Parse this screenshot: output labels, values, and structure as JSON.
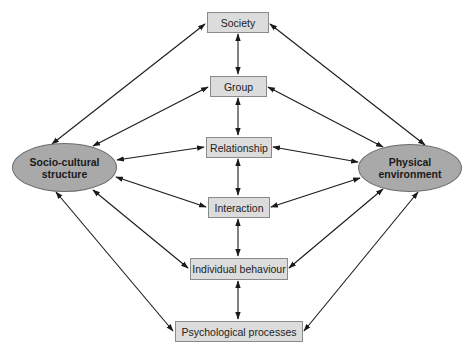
{
  "diagram": {
    "nodes": {
      "society": "Society",
      "group": "Group",
      "relationship": "Relationship",
      "interaction": "Interaction",
      "individual_behaviour": "Individual behaviour",
      "psychological_processes": "Psychological processes",
      "socio_cultural_line1": "Socio-cultural",
      "socio_cultural_line2": "structure",
      "physical_line1": "Physical",
      "physical_line2": "environment"
    },
    "edges": [
      [
        "Society",
        "Group",
        "bidirectional"
      ],
      [
        "Group",
        "Relationship",
        "bidirectional"
      ],
      [
        "Relationship",
        "Interaction",
        "bidirectional"
      ],
      [
        "Interaction",
        "Individual behaviour",
        "bidirectional"
      ],
      [
        "Individual behaviour",
        "Psychological processes",
        "bidirectional"
      ],
      [
        "Socio-cultural structure",
        "Society",
        "bidirectional"
      ],
      [
        "Socio-cultural structure",
        "Group",
        "bidirectional"
      ],
      [
        "Socio-cultural structure",
        "Relationship",
        "bidirectional"
      ],
      [
        "Socio-cultural structure",
        "Interaction",
        "bidirectional"
      ],
      [
        "Socio-cultural structure",
        "Individual behaviour",
        "bidirectional"
      ],
      [
        "Socio-cultural structure",
        "Psychological processes",
        "bidirectional"
      ],
      [
        "Physical environment",
        "Society",
        "bidirectional"
      ],
      [
        "Physical environment",
        "Group",
        "bidirectional"
      ],
      [
        "Physical environment",
        "Relationship",
        "bidirectional"
      ],
      [
        "Physical environment",
        "Interaction",
        "bidirectional"
      ],
      [
        "Physical environment",
        "Individual behaviour",
        "bidirectional"
      ],
      [
        "Physical environment",
        "Psychological processes",
        "bidirectional"
      ]
    ],
    "colors": {
      "box_fill": "#dcdcdc",
      "ellipse_fill": "#a9a9a9",
      "arrow": "#1a1a1a"
    }
  }
}
